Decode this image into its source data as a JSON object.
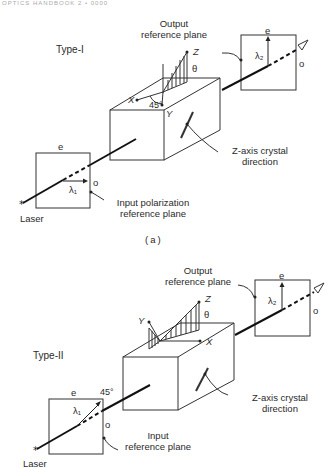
{
  "header": {
    "text": "OPTICS HANDBOOK 2 • 0000"
  },
  "panel_a": {
    "type_label": "Type-I",
    "output_label_1": "Output",
    "output_label_2": "reference plane",
    "axis_z": "Z",
    "axis_x": "X",
    "axis_y": "Y",
    "theta": "θ",
    "angle_45": "45°",
    "crystal_label_1": "Z-axis crystal",
    "crystal_label_2": "direction",
    "input_label_1": "Input polarization",
    "input_label_2": "reference plane",
    "in_e": "e",
    "in_o": "o",
    "lambda1": "λ₁",
    "out_e": "e",
    "out_o": "o",
    "lambda2": "λ₂",
    "laser": "Laser",
    "caption": "(a)"
  },
  "panel_b": {
    "type_label": "Type-II",
    "output_label_1": "Output",
    "output_label_2": "reference plane",
    "axis_z": "Z",
    "axis_x": "X",
    "axis_y": "Y",
    "theta": "θ",
    "angle_45": "45°",
    "crystal_label_1": "Z-axis crystal",
    "crystal_label_2": "direction",
    "input_label_1": "Input",
    "input_label_2": "reference plane",
    "in_e": "e",
    "in_o": "o",
    "lambda1": "λ₁",
    "out_e": "e",
    "out_o": "o",
    "lambda2": "λ₂",
    "laser": "Laser"
  }
}
